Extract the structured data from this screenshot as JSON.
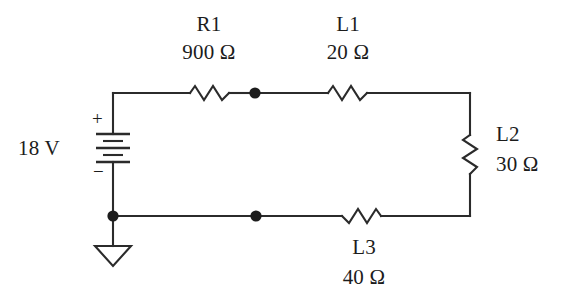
{
  "figure": {
    "background_color": "#ffffff",
    "line_color": "#2b2b2b"
  },
  "source": {
    "name": "18 V",
    "value_label": "18 V",
    "type": "dc-voltage-source",
    "polarity_plus": "+",
    "polarity_minus": "−"
  },
  "components": {
    "r1": {
      "name": "R1",
      "value": "900 Ω",
      "orientation": "horizontal",
      "position": "top-left"
    },
    "l1": {
      "name": "L1",
      "value": "20 Ω",
      "orientation": "horizontal",
      "position": "top-right"
    },
    "l2": {
      "name": "L2",
      "value": "30 Ω",
      "orientation": "vertical",
      "position": "right"
    },
    "l3": {
      "name": "L3",
      "value": "40 Ω",
      "orientation": "horizontal",
      "position": "bottom-right"
    }
  },
  "nodes": {
    "top_junction": "node-top",
    "bottom_junction": "node-bottom",
    "ground_node": "node-ground"
  },
  "ground": {
    "symbol": "earth-ground-triangle"
  }
}
